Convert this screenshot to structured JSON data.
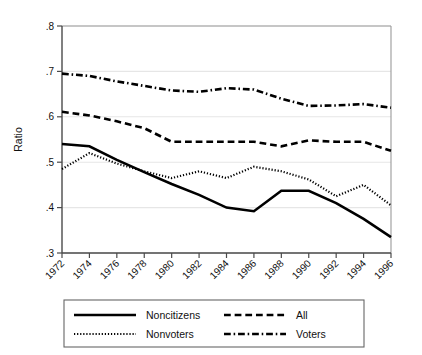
{
  "chart_data": {
    "type": "line",
    "title": "",
    "subtitle": "",
    "xlabel": "",
    "ylabel": "Ratio",
    "xlim": [
      1972,
      1996
    ],
    "ylim": [
      0.3,
      0.8
    ],
    "grid": true,
    "grid_axis": "y",
    "legend_position": "below-axes",
    "categories": [
      1972,
      1974,
      1976,
      1978,
      1980,
      1982,
      1984,
      1986,
      1988,
      1990,
      1992,
      1994,
      1996
    ],
    "xtick_labels": [
      "1972",
      "1974",
      "1976",
      "1978",
      "1980",
      "1982",
      "1984",
      "1986",
      "1988",
      "1990",
      "1992",
      "1994",
      "1996"
    ],
    "ytick_labels": [
      ".3",
      ".4",
      ".5",
      ".6",
      ".7",
      ".8"
    ],
    "ytick_values": [
      0.3,
      0.4,
      0.5,
      0.6,
      0.7,
      0.8
    ],
    "series": [
      {
        "name": "Noncitizens",
        "style": "solid",
        "color": "#000000",
        "width": 2.6,
        "values": [
          0.54,
          0.535,
          0.505,
          0.478,
          0.452,
          0.428,
          0.4,
          0.392,
          0.437,
          0.437,
          0.41,
          0.375,
          0.335
        ]
      },
      {
        "name": "All",
        "style": "dashed",
        "color": "#000000",
        "width": 2.6,
        "values": [
          0.611,
          0.603,
          0.59,
          0.575,
          0.545,
          0.545,
          0.545,
          0.545,
          0.535,
          0.548,
          0.545,
          0.545,
          0.525
        ]
      },
      {
        "name": "Nonvoters",
        "style": "dotted",
        "color": "#000000",
        "width": 2.2,
        "values": [
          0.485,
          0.52,
          0.497,
          0.48,
          0.465,
          0.48,
          0.465,
          0.49,
          0.48,
          0.462,
          0.425,
          0.45,
          0.405
        ]
      },
      {
        "name": "Voters",
        "style": "dashdot",
        "color": "#000000",
        "width": 2.6,
        "values": [
          0.695,
          0.69,
          0.678,
          0.668,
          0.658,
          0.655,
          0.663,
          0.66,
          0.64,
          0.624,
          0.625,
          0.628,
          0.62
        ]
      }
    ]
  },
  "legend": {
    "entries": [
      {
        "label": "Noncitizens",
        "style": "solid"
      },
      {
        "label": "All",
        "style": "dashed"
      },
      {
        "label": "Nonvoters",
        "style": "dotted"
      },
      {
        "label": "Voters",
        "style": "dashdot"
      }
    ]
  },
  "colors": {
    "ink": "#000000",
    "axis": "#4a4a4a",
    "grid": "#e6e6e6",
    "frame": "#9a9a9a",
    "background": "#ffffff"
  }
}
